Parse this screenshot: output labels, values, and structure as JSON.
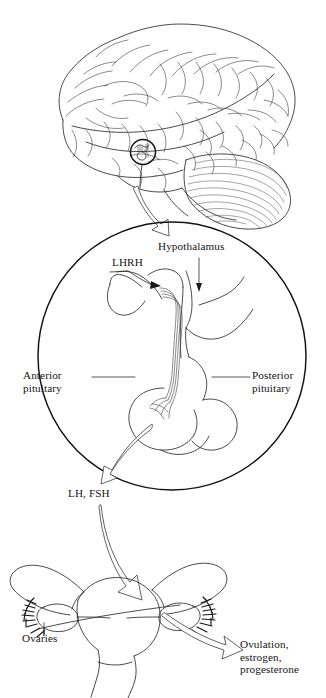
{
  "figure": {
    "background_color": "#ffffff",
    "ink_color": "#2b2b2b"
  },
  "labels": {
    "lhrh": "LHRH",
    "hypothalamus": "Hypothalamus",
    "anterior_pituitary": "Anterior\npituitary",
    "posterior_pituitary": "Posterior\npituitary",
    "lh_fsh": "LH, FSH",
    "ovaries": "Ovaries",
    "ovulation_hormones": "Ovulation,\nestrogen,\nprogesterone"
  },
  "panels": {
    "brain": {
      "name": "brain-lateral-view",
      "features": [
        "cerebrum",
        "cerebellum",
        "brainstem",
        "hypothalamus-marker-circle"
      ]
    },
    "detail_circle": {
      "name": "hypothalamus-pituitary-detail",
      "center_x": 172,
      "center_y": 356,
      "radius": 134,
      "features": [
        "hypothalamus",
        "pituitary-stalk",
        "portal-vessels",
        "anterior-pituitary",
        "posterior-pituitary"
      ]
    },
    "reproductive": {
      "name": "uterus-ovaries",
      "features": [
        "uterus",
        "fallopian-tubes",
        "fimbriae",
        "ovaries",
        "cervix",
        "vagina"
      ]
    }
  },
  "arrows": [
    {
      "name": "brain-to-detail-circle",
      "from": "hypothalamus-marker",
      "to": "detail-circle",
      "style": "hollow-outline"
    },
    {
      "name": "pituitary-to-lhfsh",
      "from": "anterior-pituitary",
      "to": "LH, FSH",
      "style": "hollow-outline"
    },
    {
      "name": "lhfsh-to-ovary",
      "from": "LH, FSH",
      "to": "ovary",
      "style": "hollow-outline"
    },
    {
      "name": "ovary-to-ovulation",
      "from": "ovary",
      "to": "Ovulation, estrogen, progesterone",
      "style": "hollow-outline"
    },
    {
      "name": "lhrh-pointer",
      "from": "LHRH",
      "to": "portal-vessels",
      "style": "solid-small"
    },
    {
      "name": "hypothalamus-pointer",
      "from": "Hypothalamus",
      "to": "hypothalamus-body",
      "style": "solid-small"
    }
  ]
}
